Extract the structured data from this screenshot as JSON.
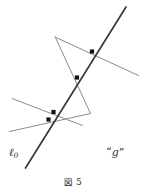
{
  "figure": {
    "caption_symbol": "図",
    "caption_number": "5",
    "background_color": "#ffffff",
    "main_line_color": "#3a3a3a",
    "secondary_line_color": "#8c8c8c",
    "point_color": "#141414",
    "labels": {
      "line_label": "ℓ",
      "line_label_subscript": "0",
      "pencil_label_open_quote": "“",
      "pencil_label_symbol": "g",
      "pencil_label_close_quote": "”"
    },
    "geometry": {
      "width": 146,
      "height": 175,
      "lines": [
        {
          "name": "line-l0-main",
          "role": "primary",
          "x1": 25.5,
          "y1": 168.0,
          "x2": 126.0,
          "y2": 7.0,
          "stroke": "#3a3a3a",
          "stroke_width": 1.7
        },
        {
          "name": "transversal-upper-shallow",
          "role": "secondary",
          "x1": 56.0,
          "y1": 37.5,
          "x2": 138.5,
          "y2": 75.5,
          "stroke": "#8c8c8c",
          "stroke_width": 1.0
        },
        {
          "name": "transversal-steep-descending",
          "role": "secondary",
          "x1": 55.0,
          "y1": 36.5,
          "x2": 90.5,
          "y2": 113.5,
          "stroke": "#8c8c8c",
          "stroke_width": 1.0
        },
        {
          "name": "transversal-lower-upper-shallow",
          "role": "secondary",
          "x1": 12.0,
          "y1": 98.5,
          "x2": 82.5,
          "y2": 125.5,
          "stroke": "#8c8c8c",
          "stroke_width": 1.0
        },
        {
          "name": "transversal-lower-ascending",
          "role": "secondary",
          "x1": 9.5,
          "y1": 131.5,
          "x2": 90.5,
          "y2": 113.5,
          "stroke": "#8c8c8c",
          "stroke_width": 1.0
        }
      ],
      "points": [
        {
          "name": "intersection-point-upper",
          "x": 92.0,
          "y": 51.5,
          "size": 4.2
        },
        {
          "name": "intersection-point-middle",
          "x": 77.0,
          "y": 77.5,
          "size": 4.2
        },
        {
          "name": "intersection-point-lower-upper",
          "x": 53.5,
          "y": 112.0,
          "size": 4.2
        },
        {
          "name": "intersection-point-lower-lower",
          "x": 48.5,
          "y": 119.5,
          "size": 4.2
        }
      ]
    }
  }
}
